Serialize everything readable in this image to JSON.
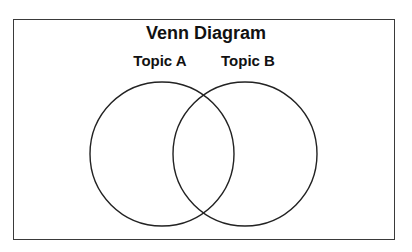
{
  "diagram": {
    "title": "Venn Diagram",
    "sets": [
      {
        "label": "Topic A",
        "cx": 162,
        "cy": 154,
        "r": 72
      },
      {
        "label": "Topic B",
        "cx": 245,
        "cy": 154,
        "r": 72
      }
    ],
    "stroke_color": "#222222",
    "frame_color": "#3a3a3a"
  }
}
